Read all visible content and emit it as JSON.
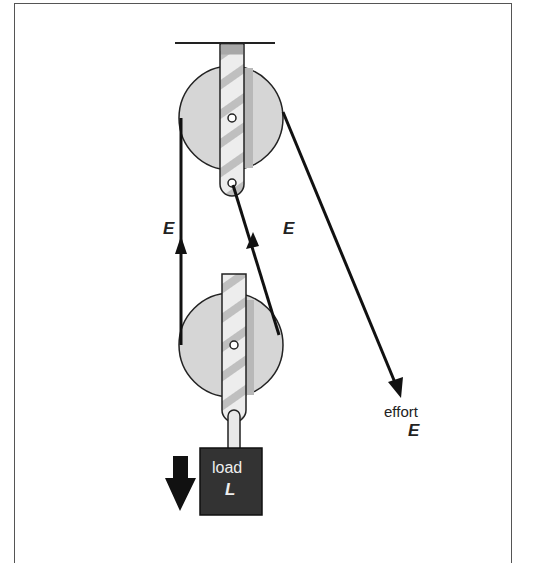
{
  "diagram": {
    "labels": {
      "left_rope_tension": "E",
      "middle_rope_tension": "E",
      "effort_word": "effort",
      "effort_symbol": "E",
      "load_word": "load",
      "load_symbol": "L"
    },
    "components": [
      "ceiling support",
      "fixed upper pulley",
      "movable lower pulley",
      "rope",
      "load block",
      "load direction arrow",
      "effort arrow"
    ],
    "colors": {
      "pulley_fill": "#d4d4d4",
      "strap_fill": "#ececec",
      "strap_stripe": "#bdbdbd",
      "rope": "#111111",
      "load_fill": "#333333",
      "frame": "#555555"
    }
  }
}
